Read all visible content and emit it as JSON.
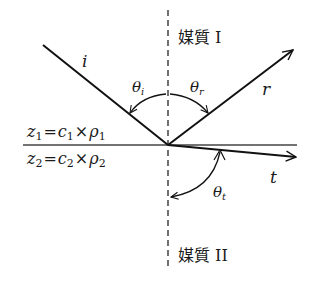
{
  "diagram": {
    "media": {
      "upper": "媒質 I",
      "lower": "媒質 II"
    },
    "impedance": {
      "upper": {
        "lhs": "z",
        "sub": "1",
        "eq": "=",
        "c": "c",
        "c_sub": "1",
        "times": "×",
        "rho": "ρ",
        "rho_sub": "1"
      },
      "lower": {
        "lhs": "z",
        "sub": "2",
        "eq": "=",
        "c": "c",
        "c_sub": "2",
        "times": "×",
        "rho": "ρ",
        "rho_sub": "2"
      }
    },
    "rays": {
      "incident": "i",
      "reflected": "r",
      "transmitted": "t"
    },
    "angles": {
      "incident": {
        "symbol": "θ",
        "sub": "i"
      },
      "reflected": {
        "symbol": "θ",
        "sub": "r"
      },
      "transmitted": {
        "symbol": "θ",
        "sub": "t"
      }
    },
    "colors": {
      "line": "#111111",
      "background": "#ffffff"
    }
  }
}
